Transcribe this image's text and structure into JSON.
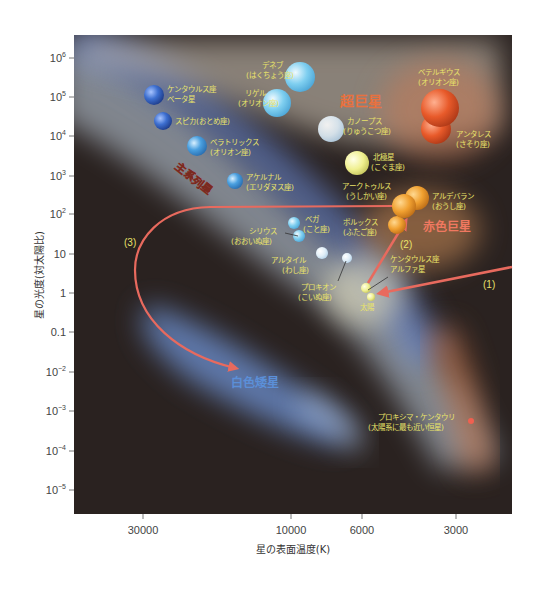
{
  "chart_data": {
    "type": "scatter",
    "title": "",
    "xlabel": "星の表面温度(K)",
    "ylabel": "星の光度(対太陽比)",
    "x_scale": "log (reversed, hot→cool)",
    "y_scale": "log",
    "x_ticks": [
      "30000",
      "10000",
      "6000",
      "3000"
    ],
    "y_ticks": [
      "10^6",
      "10^5",
      "10^4",
      "10^3",
      "10^2",
      "10",
      "1",
      "0.1",
      "10^-2",
      "10^-3",
      "10^-4",
      "10^-5"
    ],
    "xlim": [
      60000,
      2000
    ],
    "ylim": [
      3e-06,
      3000000
    ],
    "grid": false,
    "legend": "none",
    "regions": [
      {
        "name": "超巨星",
        "color": "#e8713f"
      },
      {
        "name": "主系列星",
        "color": "#f08a80"
      },
      {
        "name": "赤色巨星",
        "color": "#f07860"
      },
      {
        "name": "白色矮星",
        "color": "#5b8fd8"
      }
    ],
    "stars": [
      {
        "name": "ケンタウルス座ベータ星",
        "temp": 25000,
        "lum": 100000,
        "color": "#3d6fd0"
      },
      {
        "name": "スピカ(おとめ座)",
        "temp": 23000,
        "lum": 20000,
        "color": "#3d6fd0"
      },
      {
        "name": "ベラトリックス(オリオン座)",
        "temp": 21000,
        "lum": 6000,
        "color": "#4aa0e0"
      },
      {
        "name": "アケルナル(エリダヌス座)",
        "temp": 15000,
        "lum": 700,
        "color": "#5ab0e8"
      },
      {
        "name": "デネブ(はくちょう座)",
        "temp": 9500,
        "lum": 200000,
        "color": "#7fcff0"
      },
      {
        "name": "リゲル(オリオン座)",
        "temp": 11000,
        "lum": 80000,
        "color": "#7fcff0"
      },
      {
        "name": "カノープス(りゅうこつ座)",
        "temp": 7500,
        "lum": 12000,
        "color": "#e0eef8"
      },
      {
        "name": "ベテルギウス(オリオン座)",
        "temp": 3500,
        "lum": 100000,
        "color": "#e85a2a"
      },
      {
        "name": "アンタレス(さそり座)",
        "temp": 3600,
        "lum": 20000,
        "color": "#e85a2a"
      },
      {
        "name": "北極星(こぐま座)",
        "temp": 6000,
        "lum": 2000,
        "color": "#f0f090"
      },
      {
        "name": "アークトゥルス(うしかい座)",
        "temp": 4300,
        "lum": 150,
        "color": "#f0a030"
      },
      {
        "name": "アルデバラン(おうし座)",
        "temp": 4000,
        "lum": 300,
        "color": "#f0a030"
      },
      {
        "name": "ポルックス(ふたご座)",
        "temp": 4600,
        "lum": 40,
        "color": "#f0a030"
      },
      {
        "name": "ベガ(こと座)",
        "temp": 9600,
        "lum": 50,
        "color": "#a8dcf0"
      },
      {
        "name": "シリウス(おおいぬ座)",
        "temp": 9900,
        "lum": 25,
        "color": "#a8dcf0"
      },
      {
        "name": "アルタイル(わし座)",
        "temp": 7700,
        "lum": 10,
        "color": "#dceefa"
      },
      {
        "name": "プロキオン(こいぬ座)",
        "temp": 6600,
        "lum": 7,
        "color": "#f4f4d8"
      },
      {
        "name": "ケンタウルス座アルファ星",
        "temp": 5800,
        "lum": 1.5,
        "color": "#f8f8b0"
      },
      {
        "name": "太陽",
        "temp": 5800,
        "lum": 1,
        "color": "#f8f8b0"
      },
      {
        "name": "プロキシマ・ケンタウリ(太陽系に最も近い恒星)",
        "temp": 3000,
        "lum": 0.0006,
        "color": "#f06050"
      }
    ],
    "annotations": [
      "(1)",
      "(2)",
      "(3)"
    ],
    "evolution_arrows": [
      {
        "label": "(1)",
        "from": "right edge ~lum 10",
        "to": "太陽"
      },
      {
        "label": "(2)",
        "from": "太陽",
        "to": "赤色巨星"
      },
      {
        "label": "(3)",
        "from": "赤色巨星",
        "to": "白色矮星"
      }
    ]
  },
  "axes": {
    "xlabel": "星の表面温度(K)",
    "ylabel": "星の光度(対太陽比)",
    "x_ticks": [
      {
        "label": "30000",
        "x": 143
      },
      {
        "label": "10000",
        "x": 291
      },
      {
        "label": "6000",
        "x": 362
      },
      {
        "label": "3000",
        "x": 456
      }
    ],
    "y_ticks": [
      {
        "base": "10",
        "exp": "6",
        "y": 58
      },
      {
        "base": "10",
        "exp": "5",
        "y": 97
      },
      {
        "base": "10",
        "exp": "4",
        "y": 136
      },
      {
        "base": "10",
        "exp": "3",
        "y": 176
      },
      {
        "base": "10",
        "exp": "2",
        "y": 214
      },
      {
        "base": "10",
        "exp": "",
        "y": 254
      },
      {
        "base": "1",
        "exp": "",
        "y": 293
      },
      {
        "base": "0.1",
        "exp": "",
        "y": 332
      },
      {
        "base": "10",
        "exp": "−2",
        "y": 372
      },
      {
        "base": "10",
        "exp": "−3",
        "y": 411
      },
      {
        "base": "10",
        "exp": "−4",
        "y": 451
      },
      {
        "base": "10",
        "exp": "−5",
        "y": 490
      }
    ]
  },
  "regions": {
    "supergiant": "超巨星",
    "main_sequence": "主系列星",
    "red_giant": "赤色巨星",
    "white_dwarf": "白色矮星"
  },
  "labels": {
    "centaurus_beta_1": "ケンタウルス座",
    "centaurus_beta_2": "ベータ星",
    "spica": "スピカ(おとめ座)",
    "bellatrix_1": "ベラトリックス",
    "bellatrix_2": "(オリオン座)",
    "achernar_1": "アケルナル",
    "achernar_2": "(エリダヌス座)",
    "deneb_1": "デネブ",
    "deneb_2": "(はくちょう座)",
    "rigel_1": "リゲル",
    "rigel_2": "(オリオン座)",
    "canopus_1": "カノープス",
    "canopus_2": "(りゅうこつ座)",
    "betelgeuse_1": "ベテルギウス",
    "betelgeuse_2": "(オリオン座)",
    "antares_1": "アンタレス",
    "antares_2": "(さそり座)",
    "polaris_1": "北極星",
    "polaris_2": "(こぐま座)",
    "arcturus_1": "アークトゥルス",
    "arcturus_2": "(うしかい座)",
    "aldebaran_1": "アルデバラン",
    "aldebaran_2": "(おうし座)",
    "pollux_1": "ポルックス",
    "pollux_2": "(ふたご座)",
    "vega_1": "ベガ",
    "vega_2": "(こと座)",
    "sirius_1": "シリウス",
    "sirius_2": "(おおいぬ座)",
    "altair_1": "アルタイル",
    "altair_2": "(わし座)",
    "procyon_1": "プロキオン",
    "procyon_2": "(こいぬ座)",
    "alpha_cen_1": "ケンタウルス座",
    "alpha_cen_2": "アルファ星",
    "sun": "太陽",
    "proxima_1": "プロキシマ・ケンタウリ",
    "proxima_2": "(太陽系に最も近い恒星)",
    "arrow_1": "(1)",
    "arrow_2": "(2)",
    "arrow_3": "(3)"
  },
  "colors": {
    "background": "#2a2220",
    "arrow": "#e86a5e",
    "label_text": "#e9e36a"
  }
}
